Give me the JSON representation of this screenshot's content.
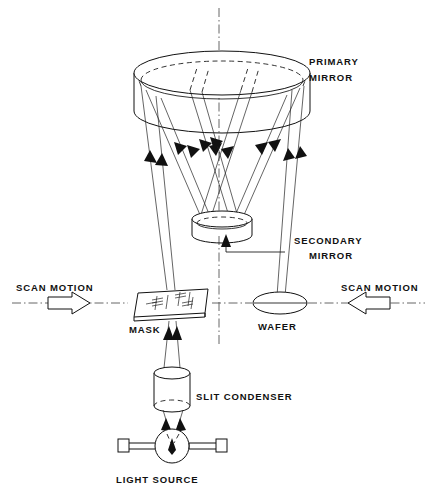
{
  "figure": {
    "background_color": "#ffffff",
    "line_color": "#111111",
    "axis_color": "#555555",
    "width": 433,
    "height": 494
  },
  "labels": {
    "primary_mirror_line1": "PRIMARY",
    "primary_mirror_line2": "MIRROR",
    "secondary_mirror_line1": "SECONDARY",
    "secondary_mirror_line2": "MIRROR",
    "scan_motion_left": "SCAN MOTION",
    "scan_motion_right": "SCAN MOTION",
    "mask": "MASK",
    "wafer": "WAFER",
    "slit_condenser": "SLIT CONDENSER",
    "light_source": "LIGHT SOURCE"
  },
  "components": [
    {
      "name": "primary-mirror",
      "shape": "annular-ring-cylinder",
      "label": "PRIMARY MIRROR",
      "center_x": 222,
      "top_y": 73,
      "rx": 88,
      "ry": 22,
      "band_height": 38
    },
    {
      "name": "secondary-mirror",
      "shape": "disc-cylinder",
      "label": "SECONDARY MIRROR",
      "center_x": 222,
      "top_y": 219,
      "rx": 30,
      "ry": 8,
      "band_height": 16
    },
    {
      "name": "mask",
      "shape": "parallelogram-plate-with-pattern",
      "label": "MASK",
      "center_x": 170,
      "center_y": 304
    },
    {
      "name": "wafer",
      "shape": "ellipse-disc",
      "label": "WAFER",
      "center_x": 280,
      "center_y": 303,
      "rx": 27,
      "ry": 11
    },
    {
      "name": "slit-condenser",
      "shape": "cylinder",
      "label": "SLIT CONDENSER",
      "center_x": 172,
      "top_y": 373,
      "rx": 18,
      "ry": 6,
      "body_height": 33
    },
    {
      "name": "light-source",
      "shape": "lamp-circle-with-electrodes",
      "label": "LIGHT SOURCE",
      "center_x": 172,
      "center_y": 446,
      "radius": 17
    }
  ],
  "scan_arrows": [
    {
      "name": "scan-arrow-left",
      "direction": "right",
      "x": 70,
      "y": 303
    },
    {
      "name": "scan-arrow-right",
      "direction": "left",
      "x": 370,
      "y": 303
    }
  ],
  "optical_axis": {
    "name": "optical-axis",
    "orientation": "vertical",
    "x": 219,
    "style": "dash-dot"
  },
  "scan_axis": {
    "name": "scan-axis",
    "orientation": "horizontal",
    "y": 303,
    "style": "dash-dot"
  }
}
